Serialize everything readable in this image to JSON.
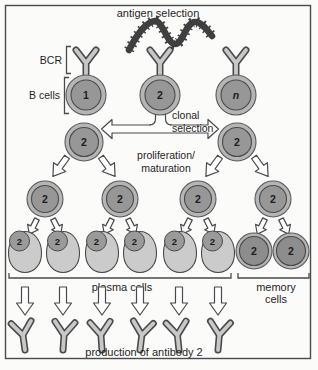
{
  "labels": {
    "antigen_selection": "antigen selection",
    "bcr": "BCR",
    "b_cells": "B cells",
    "clonal_line1": "clonal",
    "clonal_line2": "selection",
    "prolif_line1": "proliferation/",
    "prolif_line2": "maturation",
    "plasma_cells": "plasma cells",
    "memory_line1": "memory",
    "memory_line2": "cells",
    "production": "production of antibody 2"
  },
  "cells": {
    "top": [
      "1",
      "2",
      "n"
    ],
    "selected": [
      "2",
      "2"
    ],
    "expanded": [
      "2",
      "2",
      "2",
      "2"
    ],
    "plasma": [
      "2",
      "2",
      "2",
      "2",
      "2",
      "2"
    ],
    "memory": [
      "2",
      "2"
    ]
  },
  "colors": {
    "outline": "#4a4a4a",
    "cell_outer_ring": "#b5b5b5",
    "cell_inner": "#979797",
    "memory_inner": "#8d8d8d",
    "plasma_body": "#cbcbcb",
    "antigen": "#3f3f3f",
    "arrow_fill": "#ffffff",
    "background": "#fbfbfa"
  }
}
